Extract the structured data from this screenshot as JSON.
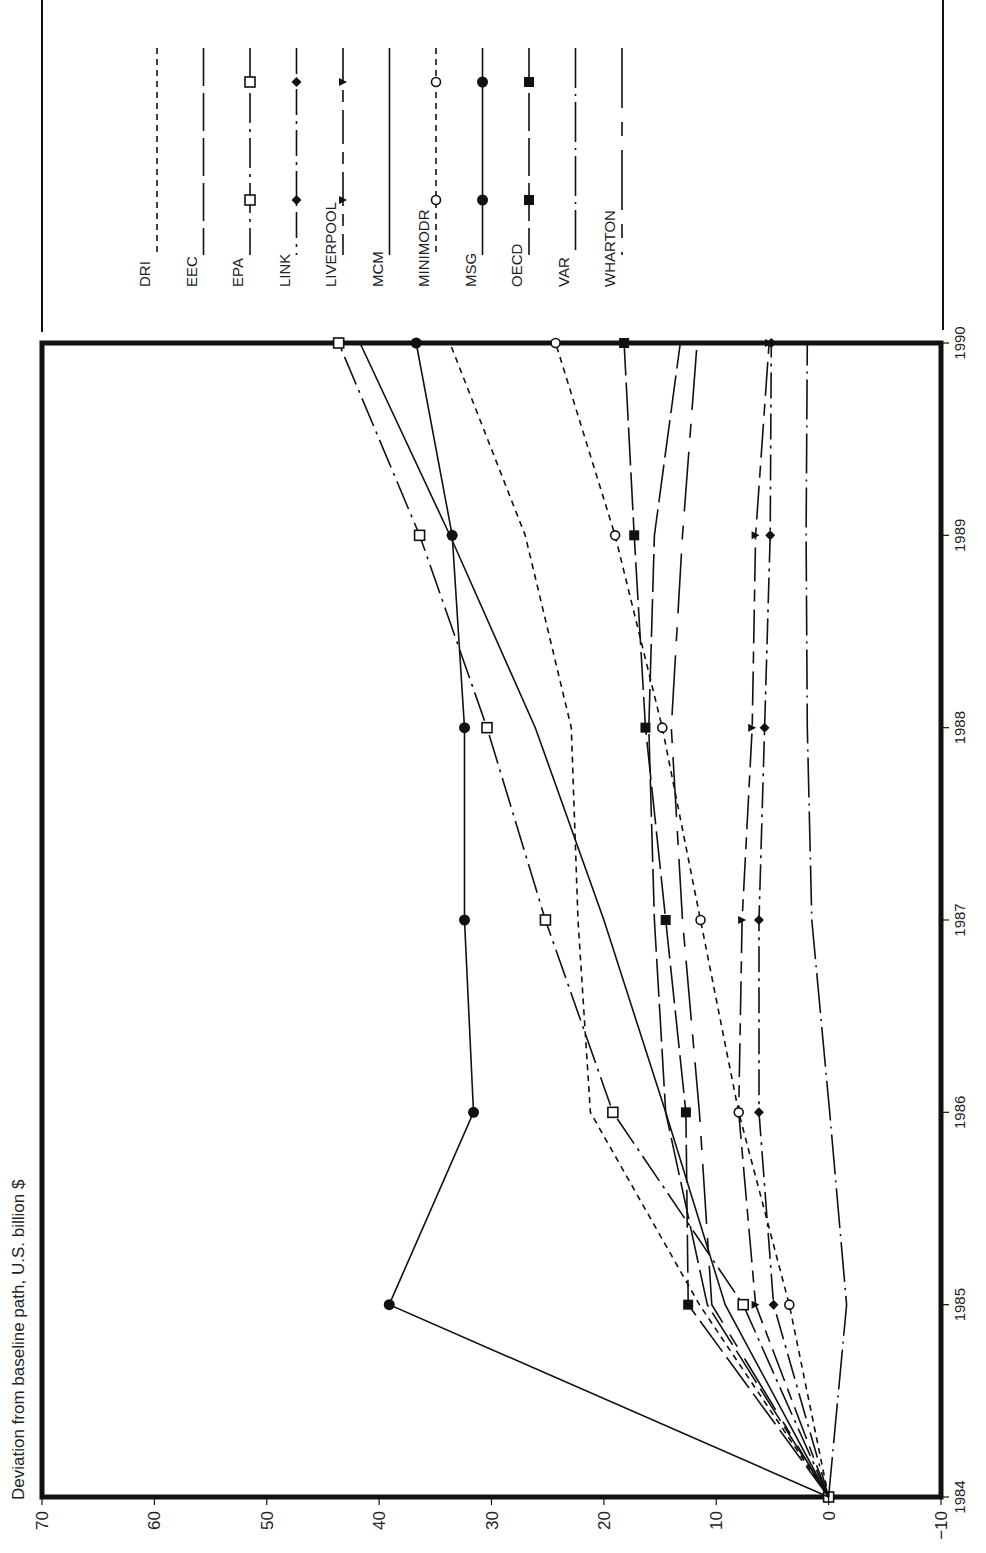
{
  "chart_data": {
    "type": "line",
    "orientation": "rotated-90-clockwise",
    "title": "",
    "xlabel": "",
    "ylabel": "Deviation from baseline path, U.S. billion $",
    "x": [
      1984,
      1985,
      1986,
      1987,
      1988,
      1989,
      1990
    ],
    "x_tick_labels": [
      "1984",
      "1985",
      "1986",
      "1987",
      "1988",
      "1989",
      "1990"
    ],
    "ylim": [
      -10,
      70
    ],
    "y_ticks": [
      70,
      60,
      50,
      40,
      30,
      20,
      10,
      0,
      -10
    ],
    "y_tick_labels": [
      "70",
      "60",
      "50",
      "40",
      "30",
      "20",
      "10",
      "0",
      "−10"
    ],
    "grid": false,
    "legend_position": "top (outside plot, rotated)",
    "series": [
      {
        "name": "DRI",
        "style": "short-dash",
        "marker": "none",
        "values": [
          0,
          11.5,
          21.2,
          22.3,
          22.9,
          27.0,
          33.7
        ]
      },
      {
        "name": "EEC",
        "style": "long-dash",
        "marker": "none",
        "values": [
          0,
          10.8,
          14.5,
          15.5,
          16.0,
          15.5,
          13.2
        ]
      },
      {
        "name": "EPA",
        "style": "dash-dot-solid",
        "marker": "open-square",
        "values": [
          0,
          7.6,
          19.2,
          25.2,
          30.4,
          36.4,
          43.6
        ]
      },
      {
        "name": "LINK",
        "style": "dash-dot",
        "marker": "filled-diamond",
        "values": [
          0,
          4.9,
          6.2,
          6.2,
          5.7,
          5.2,
          5.1
        ]
      },
      {
        "name": "LIVERPOOL",
        "style": "long-short-dash",
        "marker": "filled-triangle",
        "values": [
          0,
          6.5,
          8.0,
          7.7,
          6.8,
          6.5,
          5.3
        ]
      },
      {
        "name": "MCM",
        "style": "solid",
        "marker": "none",
        "values": [
          0,
          9.2,
          14.5,
          20.0,
          26.1,
          33.7,
          41.7
        ]
      },
      {
        "name": "MINIMODR",
        "style": "short-dash",
        "marker": "open-circle",
        "values": [
          0,
          3.5,
          8.0,
          11.4,
          14.8,
          19.0,
          24.3
        ]
      },
      {
        "name": "MSG",
        "style": "solid",
        "marker": "filled-circle",
        "values": [
          0,
          39.1,
          31.6,
          32.4,
          32.4,
          33.5,
          36.7
        ]
      },
      {
        "name": "OECD",
        "style": "long-dash",
        "marker": "filled-square",
        "values": [
          0,
          12.5,
          12.7,
          14.5,
          16.3,
          17.3,
          18.2
        ]
      },
      {
        "name": "VAR",
        "style": "long-dash-dot",
        "marker": "none",
        "values": [
          0,
          -1.6,
          -0.1,
          1.5,
          1.9,
          2.0,
          1.9
        ]
      },
      {
        "name": "WHARTON",
        "style": "long-gap-dash",
        "marker": "none",
        "values": [
          0,
          10.4,
          11.5,
          13.0,
          14.0,
          13.0,
          11.7
        ]
      }
    ]
  },
  "legend": {
    "items": [
      {
        "label": "DRI"
      },
      {
        "label": "EEC"
      },
      {
        "label": "EPA"
      },
      {
        "label": "LINK"
      },
      {
        "label": "LIVERPOOL"
      },
      {
        "label": "MCM"
      },
      {
        "label": "MINIMODR"
      },
      {
        "label": "MSG"
      },
      {
        "label": "OECD"
      },
      {
        "label": "VAR"
      },
      {
        "label": "WHARTON"
      }
    ]
  },
  "axis": {
    "value_label": "Deviation from baseline path, U.S. billion $"
  },
  "colors": {
    "ink": "#111111",
    "background": "#ffffff"
  }
}
